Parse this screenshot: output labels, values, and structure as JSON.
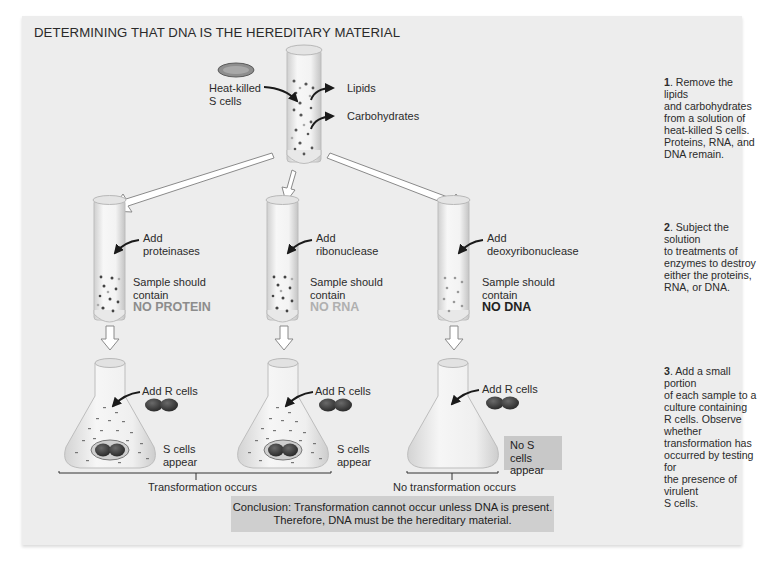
{
  "title": "DETERMINING THAT DNA IS THE HEREDITARY MATERIAL",
  "top_tube": {
    "input_label_line1": "Heat-killed",
    "input_label_line2": "S cells",
    "output_1": "Lipids",
    "output_2": "Carbohydrates"
  },
  "tubes": [
    {
      "add_line1": "Add",
      "add_line2": "proteinases",
      "sample_line1": "Sample should",
      "sample_line2": "contain",
      "result": "NO PROTEIN"
    },
    {
      "add_line1": "Add",
      "add_line2": "ribonuclease",
      "sample_line1": "Sample should",
      "sample_line2": "contain",
      "result": "NO RNA"
    },
    {
      "add_line1": "Add",
      "add_line2": "deoxyribonuclease",
      "sample_line1": "Sample should",
      "sample_line2": "contain",
      "result": "NO DNA"
    }
  ],
  "flasks": [
    {
      "add_label": "Add R cells",
      "result_line1": "S cells",
      "result_line2": "appear"
    },
    {
      "add_label": "Add R cells",
      "result_line1": "S cells",
      "result_line2": "appear"
    },
    {
      "add_label": "Add R cells",
      "result_line1": "No S cells",
      "result_line2": "appear"
    }
  ],
  "outcomes": {
    "transformation": "Transformation occurs",
    "no_transformation": "No transformation occurs"
  },
  "conclusion": {
    "line1": "Conclusion: Transformation cannot occur unless DNA is present.",
    "line2": "Therefore, DNA must be the hereditary material."
  },
  "steps": [
    {
      "number": "1",
      "text_lines": [
        "Remove the lipids",
        "and carbohydrates",
        "from a solution of",
        "heat-killed S cells.",
        "Proteins, RNA, and",
        "DNA remain."
      ]
    },
    {
      "number": "2",
      "text_lines": [
        "Subject the solution",
        "to treatments of",
        "enzymes to destroy",
        "either the proteins,",
        "RNA, or DNA."
      ]
    },
    {
      "number": "3",
      "text_lines": [
        "Add a small portion",
        "of each sample to a",
        "culture containing",
        "R cells. Observe whether",
        "transformation has",
        "occurred by testing for",
        "the presence of virulent",
        "S cells."
      ]
    }
  ]
}
